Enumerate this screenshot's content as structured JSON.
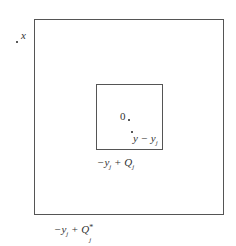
{
  "diagram": {
    "points": {
      "x": {
        "label": "x"
      },
      "origin": {
        "label": "0"
      },
      "y_minus_yj": {
        "label_main": "y − y",
        "label_sub": "j"
      }
    },
    "regions": {
      "inner": {
        "label_prefix": "−y",
        "label_prefix_sub": "j",
        "label_mid": " + Q",
        "label_sub": "j"
      },
      "outer": {
        "label_prefix": "−y",
        "label_prefix_sub": "j",
        "label_mid": " + Q",
        "label_sup": "*",
        "label_sub": "j"
      }
    },
    "colors": {
      "line": "#555555",
      "text": "#333333"
    }
  }
}
